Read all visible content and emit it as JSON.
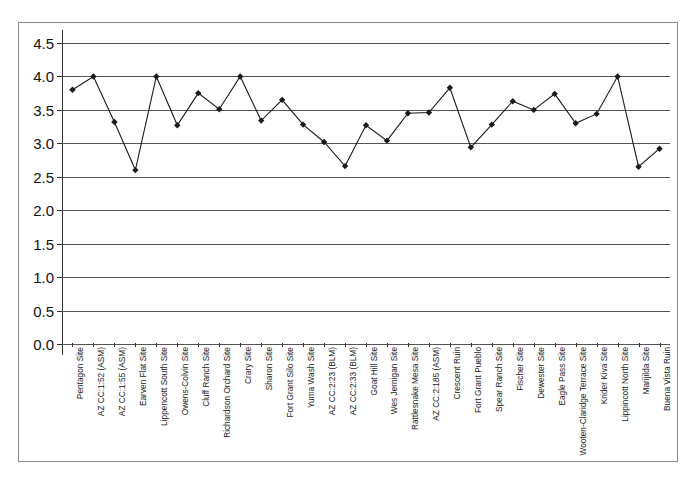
{
  "chart_data": {
    "type": "line",
    "title": "",
    "subtitle": "",
    "xlabel": "",
    "ylabel": "",
    "ylim": [
      0.0,
      4.5
    ],
    "yticks": [
      "0.0",
      "0.5",
      "1.0",
      "1.5",
      "2.0",
      "2.5",
      "3.0",
      "3.5",
      "4.0",
      "4.5"
    ],
    "ytick_values": [
      0.0,
      0.5,
      1.0,
      1.5,
      2.0,
      2.5,
      3.0,
      3.5,
      4.0,
      4.5
    ],
    "grid": true,
    "legend": "none",
    "marker": "diamond",
    "line_color": "#1a1a1a",
    "marker_color": "#1a1a1a",
    "grid_color": "#555555",
    "categories": [
      "Pentagon Site",
      "AZ CC:1:52 (ASM)",
      "AZ CC:1:55 (ASM)",
      "Earven Flat Site",
      "Lippencott South Site",
      "Owens-Colvin Site",
      "Cluff Ranch Site",
      "Richardson Orchard Site",
      "Crary Site",
      "Sharon Site",
      "Fort Grant Silo Site",
      "Yuma Wash Site",
      "AZ CC:2:23 (BLM)",
      "AZ CC:2:33 (BLM)",
      "Goat Hill Site",
      "Wes Jernigan Site",
      "Rattlesnake Mesa Site",
      "AZ CC:2:185 (ASM)",
      "Crescent Ruin",
      "Fort Grant Pueblo",
      "Spear Ranch Site",
      "Fischer Site",
      "Dewester Site",
      "Eagle Pass Site",
      "Wooten-Claridge Terrace Site",
      "Krider Kiva Site",
      "Lippincott North Site",
      "Marijilda Site",
      "Buena Vista Ruin"
    ],
    "values": [
      3.8,
      4.0,
      3.32,
      2.6,
      4.0,
      3.27,
      3.75,
      3.51,
      4.0,
      3.34,
      3.65,
      3.28,
      3.02,
      2.66,
      3.27,
      3.04,
      3.45,
      3.46,
      3.83,
      2.94,
      3.28,
      3.63,
      3.5,
      3.74,
      3.3,
      3.44,
      4.0,
      2.65,
      2.92
    ]
  }
}
